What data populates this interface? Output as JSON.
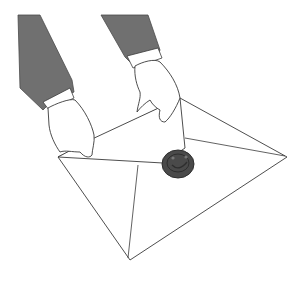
{
  "illustration": {
    "subject": "hands holding an envelope with a wax seal",
    "colors": {
      "background": "#ffffff",
      "sleeve": "#707070",
      "sleeve_dark": "#5a5a5a",
      "outline": "#3a3a3a",
      "paper": "#ffffff",
      "seal": "#4a4a4a",
      "seal_dark": "#2e2e2e"
    },
    "seal_symbol": "smiley-face"
  }
}
